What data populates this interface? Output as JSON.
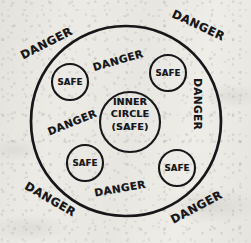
{
  "diagram": {
    "ink_color": "#17171a",
    "paper_color": "#eceae5",
    "outer_circle": {
      "label": "outer-boundary-circle",
      "cx": 126,
      "cy": 121,
      "r": 95
    },
    "inner_circle": {
      "lines": [
        "INNER",
        "CIRCLE",
        "(SAFE)"
      ],
      "cx": 130,
      "cy": 122,
      "r": 30
    },
    "safe_circles": [
      {
        "label": "SAFE",
        "cx": 70,
        "cy": 82,
        "r": 18
      },
      {
        "label": "SAFE",
        "cx": 168,
        "cy": 73,
        "r": 18
      },
      {
        "label": "SAFE",
        "cx": 85,
        "cy": 163,
        "r": 18
      },
      {
        "label": "SAFE",
        "cx": 177,
        "cy": 168,
        "r": 18
      }
    ],
    "danger_labels_outside": [
      {
        "text": "DANGER",
        "x": 18,
        "y": 36,
        "rotate": -27,
        "position": "top-left"
      },
      {
        "text": "DANGER",
        "x": 170,
        "y": 18,
        "rotate": 25,
        "position": "top-right"
      },
      {
        "text": "DANGER",
        "x": 22,
        "y": 192,
        "rotate": 30,
        "position": "bottom-left"
      },
      {
        "text": "DANGER",
        "x": 168,
        "y": 200,
        "rotate": -28,
        "position": "bottom-right"
      }
    ],
    "danger_labels_inside": [
      {
        "text": "DANGER",
        "x": 92,
        "y": 54,
        "rotate": -16,
        "position": "inner-top"
      },
      {
        "text": "DANGER",
        "x": 46,
        "y": 116,
        "rotate": -22,
        "position": "inner-left"
      },
      {
        "text": "DANGER",
        "x": 189,
        "y": 78,
        "rotate": 90,
        "position": "inner-right"
      },
      {
        "text": "DANGER",
        "x": 94,
        "y": 182,
        "rotate": -10,
        "position": "inner-bottom"
      }
    ]
  }
}
